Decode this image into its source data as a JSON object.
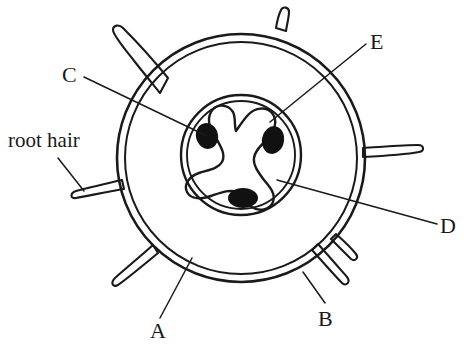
{
  "diagram": {
    "background_color": "#ffffff",
    "stroke_color": "#1a1a1a",
    "fill_color": "#111111"
  },
  "labels": {
    "root_hair": "root hair",
    "a": "A",
    "b": "B",
    "c": "C",
    "d": "D",
    "e": "E"
  },
  "structures": {
    "outer_boundary": {
      "name": "epidermis-outer-circle",
      "center": [
        241,
        158
      ],
      "radius": 124
    },
    "inner_boundary": {
      "name": "cortex-inner-circle",
      "center": [
        241,
        158
      ],
      "radius": 116
    },
    "stele_outer": {
      "name": "pericycle-circle",
      "center": [
        241,
        155
      ],
      "radius": 60
    },
    "stele_inner": {
      "name": "endodermis-circle",
      "center": [
        241,
        155
      ],
      "radius": 54
    },
    "xylem": {
      "name": "tri-radiate-xylem",
      "arms": 3
    },
    "phloem_dots": [
      {
        "name": "phloem-left",
        "center": [
          207,
          136
        ],
        "rx": 11,
        "ry": 13,
        "rotation": -15
      },
      {
        "name": "phloem-right",
        "center": [
          273,
          140
        ],
        "rx": 11,
        "ry": 14,
        "rotation": 10
      },
      {
        "name": "phloem-bottom",
        "center": [
          243,
          198
        ],
        "rx": 15,
        "ry": 10,
        "rotation": 0
      }
    ],
    "root_hairs_count": 7
  },
  "leader_lines": [
    {
      "name": "leader-c",
      "from": [
        84,
        77
      ],
      "to": [
        207,
        136
      ]
    },
    {
      "name": "leader-e",
      "from": [
        366,
        44
      ],
      "to": [
        270,
        122
      ]
    },
    {
      "name": "leader-d",
      "from": [
        437,
        224
      ],
      "to": [
        277,
        180
      ]
    },
    {
      "name": "leader-a",
      "from": [
        160,
        318
      ],
      "to": [
        192,
        258
      ]
    },
    {
      "name": "leader-b",
      "from": [
        325,
        303
      ],
      "to": [
        303,
        272
      ]
    },
    {
      "name": "leader-root-hair",
      "from": [
        58,
        158
      ],
      "to": [
        82,
        190
      ]
    }
  ]
}
